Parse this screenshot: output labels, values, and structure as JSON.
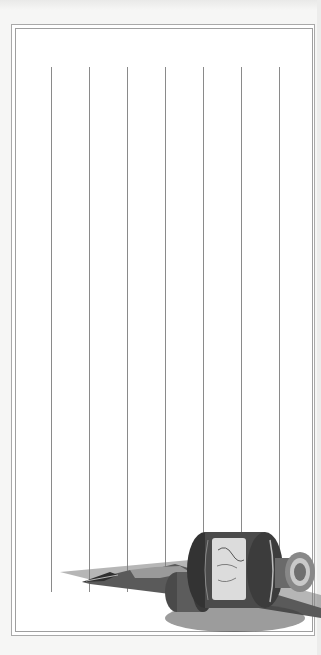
{
  "page": {
    "kind": "lined-stationery",
    "background": "#f6f6f5",
    "paper_color": "#ffffff",
    "border_color": "#a9a9a9",
    "rule_color": "#8a8a8a",
    "rules": {
      "orientation": "vertical",
      "count": 7,
      "x_positions": [
        51,
        89,
        127,
        165,
        203,
        241,
        279
      ],
      "top": 67,
      "bottom": 592
    }
  },
  "illustration": {
    "subject": "ink-bottle-and-dip-pen",
    "bottle_label": "illegible script label",
    "icon": "ink-bottle-icon"
  }
}
